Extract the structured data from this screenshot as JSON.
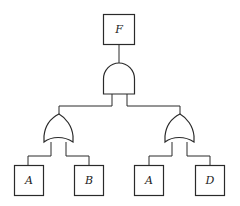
{
  "diagram": {
    "type": "fault-tree",
    "top_event": {
      "label": "F"
    },
    "top_gate": {
      "type": "AND"
    },
    "left_branch": {
      "gate": {
        "type": "OR"
      },
      "events": [
        {
          "label": "A"
        },
        {
          "label": "B"
        }
      ]
    },
    "right_branch": {
      "gate": {
        "type": "OR"
      },
      "events": [
        {
          "label": "A"
        },
        {
          "label": "D"
        }
      ]
    }
  }
}
